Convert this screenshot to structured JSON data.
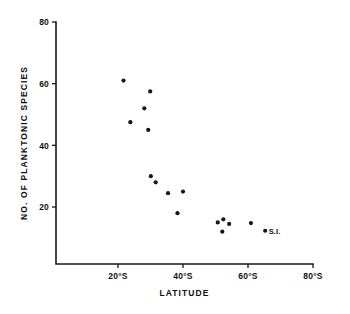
{
  "chart_data": {
    "type": "scatter",
    "title": "",
    "xlabel": "LATITUDE",
    "ylabel": "NO. OF PLANKTONIC SPECIES",
    "xlim": [
      10,
      80
    ],
    "ylim": [
      0,
      80
    ],
    "xticks": [
      20,
      40,
      60,
      80
    ],
    "xtick_labels": [
      "20°S",
      "40°S",
      "60°S",
      "80°S"
    ],
    "yticks": [
      20,
      40,
      60,
      80
    ],
    "ytick_labels": [
      "20",
      "40",
      "60",
      "80"
    ],
    "grid": false,
    "legend": "none",
    "marker": "filled-circle",
    "marker_color": "#161616",
    "axis_color": "#1a1a1a",
    "background_color": "#ffffff",
    "points": [
      {
        "x": 21.7,
        "y": 61.0,
        "label": ""
      },
      {
        "x": 29.9,
        "y": 57.5,
        "label": ""
      },
      {
        "x": 28.1,
        "y": 52.0,
        "label": ""
      },
      {
        "x": 23.8,
        "y": 47.5,
        "label": ""
      },
      {
        "x": 29.3,
        "y": 45.0,
        "label": ""
      },
      {
        "x": 30.1,
        "y": 30.0,
        "label": ""
      },
      {
        "x": 31.6,
        "y": 28.0,
        "label": ""
      },
      {
        "x": 35.4,
        "y": 24.5,
        "label": ""
      },
      {
        "x": 40.0,
        "y": 25.0,
        "label": ""
      },
      {
        "x": 38.3,
        "y": 18.0,
        "label": ""
      },
      {
        "x": 50.7,
        "y": 15.0,
        "label": ""
      },
      {
        "x": 52.4,
        "y": 16.0,
        "label": ""
      },
      {
        "x": 54.2,
        "y": 14.5,
        "label": ""
      },
      {
        "x": 52.1,
        "y": 12.0,
        "label": ""
      },
      {
        "x": 60.9,
        "y": 14.8,
        "label": ""
      },
      {
        "x": 65.3,
        "y": 12.3,
        "label": "S.I."
      }
    ]
  }
}
